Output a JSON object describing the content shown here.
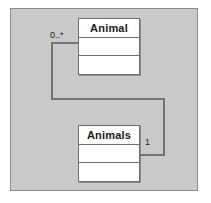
{
  "diagram": {
    "type": "uml-class-diagram",
    "background_color": "#c9c9c9",
    "frame_border_color": "#8c8c8c",
    "line_color": "#5a5a5a",
    "classes": [
      {
        "id": "animal",
        "name": "Animal",
        "attributes": "",
        "operations": ""
      },
      {
        "id": "animals",
        "name": "Animals",
        "attributes": "",
        "operations": ""
      }
    ],
    "association": {
      "source_multiplicity": "0..*",
      "target_multiplicity": "1",
      "routing": "orthogonal"
    }
  }
}
